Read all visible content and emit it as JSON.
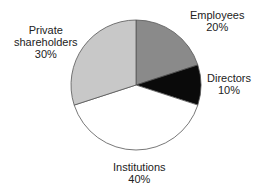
{
  "chart_data": {
    "type": "pie",
    "title": "",
    "categories": [
      "Employees",
      "Directors",
      "Institutions",
      "Private shareholders"
    ],
    "values": [
      20,
      10,
      40,
      30
    ],
    "unit": "%",
    "colors": [
      "#8a8a8a",
      "#0a0a0a",
      "#ffffff",
      "#c8c8c8"
    ],
    "start_angle_deg": 0,
    "direction": "clockwise from 12 o'clock",
    "labels": [
      {
        "name": "Employees",
        "value": "20%"
      },
      {
        "name": "Directors",
        "value": "10%"
      },
      {
        "name": "Institutions",
        "value": "40%"
      },
      {
        "name": "Private",
        "name2": "shareholders",
        "value": "30%"
      }
    ],
    "legend": "none (direct labels)"
  }
}
